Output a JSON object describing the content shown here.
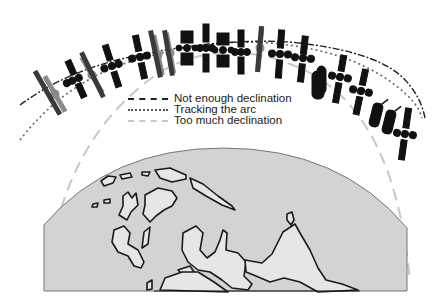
{
  "diagram": {
    "legend": [
      {
        "key": "not_enough",
        "label": "Not enough declination",
        "style": "dash-dot",
        "color": "#222222"
      },
      {
        "key": "tracking",
        "label": "Tracking the arc",
        "style": "dotted",
        "color": "#555555"
      },
      {
        "key": "too_much",
        "label": "Too much declination",
        "style": "dashed",
        "color": "#c8c8c8"
      }
    ],
    "colors": {
      "background": "#ffffff",
      "earth_fill": "#d3d3d3",
      "land_fill": "#e6e6e6",
      "coast_stroke": "#1a1a1a",
      "satellite": "#111111",
      "satellite_ghost": "#9a9a9a"
    },
    "elements": {
      "earth_cap": "Earth hemisphere with continents (map view)",
      "arcs": [
        "not-enough-declination-arc",
        "tracking-arc",
        "too-much-declination-arc"
      ],
      "satellite_count": 20
    }
  }
}
